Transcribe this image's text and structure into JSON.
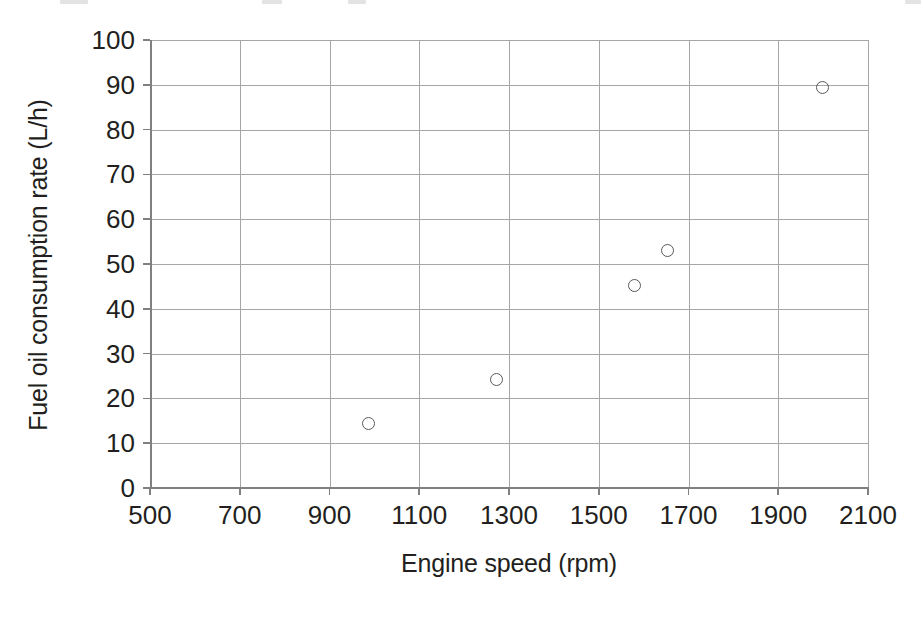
{
  "chart_data": {
    "type": "scatter",
    "title": "",
    "xlabel": "Engine speed (rpm)",
    "ylabel": "Fuel oil consumption rate (L/h)",
    "xlim": [
      500,
      2100
    ],
    "ylim": [
      0,
      100
    ],
    "xticks": [
      500,
      700,
      900,
      1100,
      1300,
      1500,
      1700,
      1900,
      2100
    ],
    "yticks": [
      0,
      10,
      20,
      30,
      40,
      50,
      60,
      70,
      80,
      90,
      100
    ],
    "xtick_labels": [
      "500",
      "700",
      "900",
      "1100",
      "1300",
      "1500",
      "1700",
      "1900",
      "2100"
    ],
    "ytick_labels": [
      "0",
      "10",
      "20",
      "30",
      "40",
      "50",
      "60",
      "70",
      "80",
      "90",
      "100"
    ],
    "grid": true,
    "grid_color": "#a6a6a6",
    "legend": null,
    "marker_style": "open-circle",
    "marker_color": "#58595b",
    "series": [
      {
        "name": "Fuel oil consumption rate",
        "points": [
          {
            "x": 988,
            "y": 14.5
          },
          {
            "x": 1273,
            "y": 24.3
          },
          {
            "x": 1580,
            "y": 45.3
          },
          {
            "x": 1654,
            "y": 53.1
          },
          {
            "x": 1998,
            "y": 89.4
          }
        ]
      }
    ]
  }
}
